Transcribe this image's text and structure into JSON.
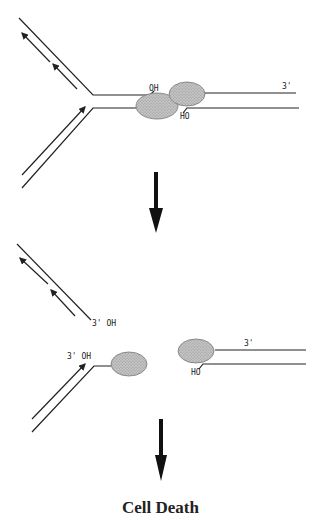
{
  "diagram": {
    "top_panel": {
      "labels": {
        "oh_upper": "OH",
        "ho_lower": "HO",
        "three_prime": "3'"
      }
    },
    "bottom_panel": {
      "labels": {
        "upper_three_prime_oh": "3' OH",
        "lower_three_prime_oh": "3' OH",
        "ho": "HO",
        "three_prime": "3'"
      }
    },
    "result_label": "Cell Death",
    "colors": {
      "line": "#222222",
      "protein_fill": "#b8b8b8"
    }
  }
}
